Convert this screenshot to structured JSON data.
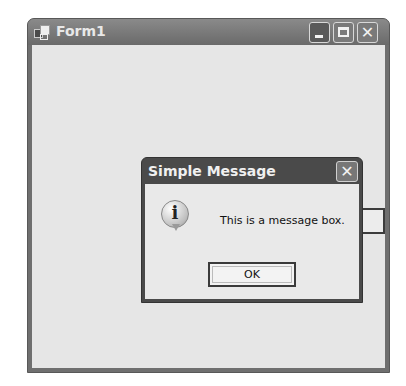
{
  "main_window": {
    "title": "Form1",
    "icon": "form-app-icon",
    "controls": {
      "minimize": "minimize-icon",
      "maximize": "maximize-icon",
      "close": "close-icon",
      "close_glyph": "✕"
    }
  },
  "background_button": {
    "label": ""
  },
  "dialog": {
    "title": "Simple Message",
    "close_glyph": "✕",
    "icon": "information-icon",
    "icon_glyph": "i",
    "message": "This is a message box.",
    "ok_label": "OK"
  }
}
